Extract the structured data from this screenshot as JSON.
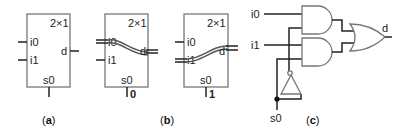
{
  "figure": {
    "panels": [
      {
        "id": "a",
        "caption_open": "(",
        "caption_letter": "a",
        "caption_close": ")",
        "mux": {
          "size_label": "2×1",
          "input0": "i0",
          "input1": "i1",
          "output": "d",
          "select": "s0"
        }
      },
      {
        "id": "b",
        "caption_open": "(",
        "caption_letter": "b",
        "caption_close": ")",
        "mux_s0_0": {
          "size_label": "2×1",
          "input0": "i0",
          "input1": "i1",
          "output": "d",
          "select": "s0",
          "select_value": "0",
          "routed_input": "i0"
        },
        "mux_s0_1": {
          "size_label": "2×1",
          "input0": "i0",
          "input1": "i1",
          "output": "d",
          "select": "s0",
          "select_value": "1",
          "routed_input": "i1"
        }
      },
      {
        "id": "c",
        "caption_open": "(",
        "caption_letter": "c",
        "caption_close": ")",
        "circuit": {
          "input0": "i0",
          "input1": "i1",
          "select": "s0",
          "output": "d",
          "gates": [
            "AND",
            "AND",
            "OR",
            "NOT"
          ]
        }
      }
    ]
  }
}
